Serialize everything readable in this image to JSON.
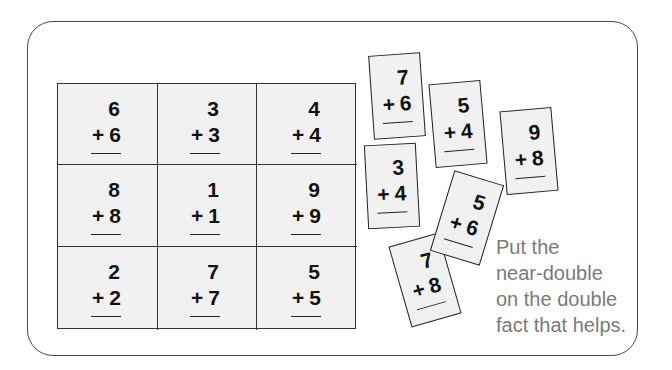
{
  "grid": {
    "cells": [
      {
        "top": "6",
        "bottom": "6"
      },
      {
        "top": "3",
        "bottom": "3"
      },
      {
        "top": "4",
        "bottom": "4"
      },
      {
        "top": "8",
        "bottom": "8"
      },
      {
        "top": "1",
        "bottom": "1"
      },
      {
        "top": "9",
        "bottom": "9"
      },
      {
        "top": "2",
        "bottom": "2"
      },
      {
        "top": "7",
        "bottom": "7"
      },
      {
        "top": "5",
        "bottom": "5"
      }
    ]
  },
  "cards": [
    {
      "top": "7",
      "bottom": "6"
    },
    {
      "top": "5",
      "bottom": "4"
    },
    {
      "top": "9",
      "bottom": "8"
    },
    {
      "top": "3",
      "bottom": "4"
    },
    {
      "top": "7",
      "bottom": "8"
    },
    {
      "top": "5",
      "bottom": "6"
    }
  ],
  "operator": "+",
  "hint": {
    "lines": [
      "Put the",
      "near-double",
      "on the double",
      "fact that helps."
    ]
  }
}
